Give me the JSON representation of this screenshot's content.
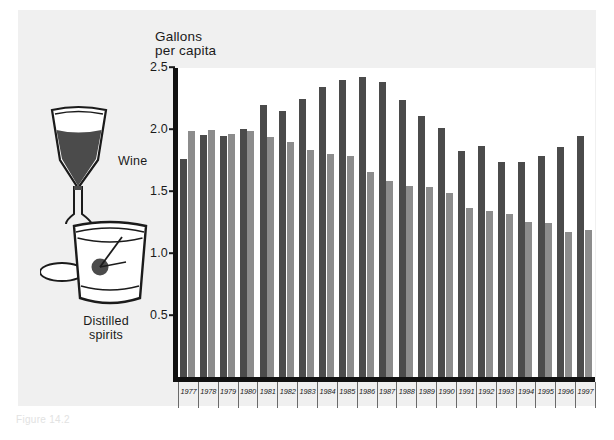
{
  "figure": {
    "panel_background": "#f0f0f0",
    "plot_background": "#ffffff",
    "caption": "Figure 14.2"
  },
  "legend": {
    "wine_label": "Wine",
    "spirits_label": "Distilled\nspirits",
    "wine_color": "#4b4b4b",
    "spirits_color": "#8c8c8c",
    "wine_icon": "wine-glass-icon",
    "spirits_icon": "rocks-glass-icon"
  },
  "chart_data": {
    "type": "bar",
    "title": "",
    "ylabel": "Gallons\nper capita",
    "xlabel": "",
    "ylim": [
      0,
      2.5
    ],
    "yticks": [
      0.5,
      1.0,
      1.5,
      2.0,
      2.5
    ],
    "ytick_labels": [
      "0.5",
      "1.0",
      "1.5",
      "2.0",
      "2.5"
    ],
    "grid": false,
    "legend_position": "left-illustration",
    "categories": [
      "1977",
      "1978",
      "1979",
      "1980",
      "1981",
      "1982",
      "1983",
      "1984",
      "1985",
      "1986",
      "1987",
      "1988",
      "1989",
      "1990",
      "1991",
      "1992",
      "1993",
      "1994",
      "1995",
      "1996",
      "1997"
    ],
    "series": [
      {
        "name": "Wine",
        "color": "#4b4b4b",
        "values": [
          1.77,
          1.96,
          1.95,
          2.01,
          2.2,
          2.15,
          2.25,
          2.35,
          2.4,
          2.43,
          2.39,
          2.24,
          2.11,
          2.02,
          1.83,
          1.87,
          1.74,
          1.74,
          1.79,
          1.86,
          1.95
        ]
      },
      {
        "name": "Distilled spirits",
        "color": "#8c8c8c",
        "values": [
          1.99,
          2.0,
          1.97,
          1.99,
          1.94,
          1.9,
          1.84,
          1.81,
          1.79,
          1.66,
          1.59,
          1.55,
          1.54,
          1.49,
          1.37,
          1.35,
          1.32,
          1.26,
          1.25,
          1.18,
          1.19
        ]
      }
    ]
  }
}
